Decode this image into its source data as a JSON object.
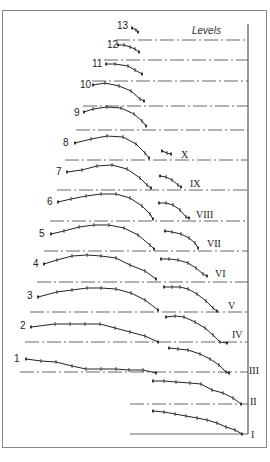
{
  "figure": {
    "legend_title": "Levels",
    "frame_color": "#888888",
    "line_color": "#222222",
    "level_labels": [
      "I",
      "II",
      "III",
      "IV",
      "V",
      "VI",
      "VII",
      "VIII",
      "IX",
      "X"
    ],
    "curve_labels": [
      "1",
      "2",
      "3",
      "4",
      "5",
      "6",
      "7",
      "8",
      "9",
      "10",
      "11",
      "12",
      "13"
    ]
  },
  "levels": [
    {
      "label": "I",
      "y": 434,
      "x1": 130
    },
    {
      "label": "II",
      "y": 404,
      "x1": 130
    },
    {
      "label": "III",
      "y": 372,
      "x1": 20
    },
    {
      "label": "IV",
      "y": 342,
      "x1": 25
    },
    {
      "label": "V",
      "y": 312,
      "x1": 30
    },
    {
      "label": "VI",
      "y": 282,
      "x1": 37
    },
    {
      "label": "VII",
      "y": 251,
      "x1": 44
    },
    {
      "label": "VIII",
      "y": 221,
      "x1": 50
    },
    {
      "label": "IX",
      "y": 190,
      "x1": 57
    },
    {
      "label": "X",
      "y": 160,
      "x1": 65
    },
    {
      "label": "",
      "y": 130,
      "x1": 76
    },
    {
      "label": "",
      "y": 106,
      "x1": 83
    },
    {
      "label": "",
      "y": 81,
      "x1": 92
    },
    {
      "label": "",
      "y": 60,
      "x1": 104
    },
    {
      "label": "",
      "y": 40,
      "x1": 116
    }
  ],
  "left_curves": [
    {
      "label": "1",
      "lx": 14,
      "ly": 362,
      "pts": [
        [
          26,
          359
        ],
        [
          41,
          361
        ],
        [
          56,
          362
        ],
        [
          72,
          366
        ],
        [
          86,
          369
        ],
        [
          101,
          369
        ],
        [
          116,
          369
        ],
        [
          129,
          370
        ],
        [
          143,
          370
        ],
        [
          156,
          373
        ]
      ]
    },
    {
      "label": "2",
      "lx": 20,
      "ly": 329,
      "pts": [
        [
          31,
          327
        ],
        [
          55,
          324
        ],
        [
          70,
          324
        ],
        [
          85,
          324
        ],
        [
          100,
          324
        ],
        [
          115,
          328
        ],
        [
          130,
          332
        ],
        [
          145,
          336
        ],
        [
          158,
          342
        ]
      ]
    },
    {
      "label": "3",
      "lx": 27,
      "ly": 299,
      "pts": [
        [
          38,
          297
        ],
        [
          57,
          292
        ],
        [
          72,
          290
        ],
        [
          87,
          288
        ],
        [
          101,
          288
        ],
        [
          116,
          289
        ],
        [
          131,
          293
        ],
        [
          145,
          300
        ],
        [
          158,
          310
        ]
      ]
    },
    {
      "label": "4",
      "lx": 33,
      "ly": 267,
      "pts": [
        [
          44,
          264
        ],
        [
          57,
          260
        ],
        [
          72,
          256
        ],
        [
          87,
          255
        ],
        [
          101,
          256
        ],
        [
          116,
          258
        ],
        [
          130,
          265
        ],
        [
          145,
          271
        ],
        [
          156,
          279
        ]
      ]
    },
    {
      "label": "5",
      "lx": 39,
      "ly": 237,
      "pts": [
        [
          51,
          234
        ],
        [
          64,
          231
        ],
        [
          79,
          227
        ],
        [
          94,
          225
        ],
        [
          109,
          225
        ],
        [
          124,
          228
        ],
        [
          138,
          235
        ],
        [
          150,
          245
        ],
        [
          154,
          249
        ]
      ]
    },
    {
      "label": "6",
      "lx": 47,
      "ly": 205,
      "pts": [
        [
          58,
          202
        ],
        [
          71,
          199
        ],
        [
          86,
          196
        ],
        [
          101,
          194
        ],
        [
          116,
          194
        ],
        [
          130,
          198
        ],
        [
          142,
          206
        ],
        [
          150,
          214
        ],
        [
          153,
          219
        ]
      ]
    },
    {
      "label": "7",
      "lx": 56,
      "ly": 175,
      "pts": [
        [
          67,
          172
        ],
        [
          82,
          170
        ],
        [
          97,
          166
        ],
        [
          112,
          165
        ],
        [
          127,
          169
        ],
        [
          140,
          178
        ],
        [
          147,
          185
        ],
        [
          151,
          188
        ]
      ]
    },
    {
      "label": "8",
      "lx": 63,
      "ly": 146,
      "pts": [
        [
          75,
          143
        ],
        [
          91,
          139
        ],
        [
          107,
          136
        ],
        [
          123,
          137
        ],
        [
          136,
          144
        ],
        [
          145,
          153
        ],
        [
          149,
          158
        ]
      ]
    },
    {
      "label": "9",
      "lx": 74,
      "ly": 116,
      "pts": [
        [
          84,
          112
        ],
        [
          93,
          109
        ],
        [
          107,
          107
        ],
        [
          121,
          108
        ],
        [
          134,
          114
        ],
        [
          142,
          121
        ],
        [
          146,
          126
        ]
      ]
    },
    {
      "label": "10",
      "lx": 80,
      "ly": 88,
      "pts": [
        [
          93,
          85
        ],
        [
          105,
          83
        ],
        [
          119,
          86
        ],
        [
          131,
          91
        ],
        [
          140,
          99
        ],
        [
          144,
          101
        ]
      ]
    },
    {
      "label": "11",
      "lx": 92,
      "ly": 67,
      "pts": [
        [
          106,
          64
        ],
        [
          115,
          64
        ],
        [
          128,
          66
        ],
        [
          135,
          70
        ],
        [
          142,
          74
        ]
      ]
    },
    {
      "label": "12",
      "lx": 107,
      "ly": 48,
      "pts": [
        [
          118,
          45
        ],
        [
          124,
          45
        ],
        [
          130,
          47
        ],
        [
          135,
          49
        ],
        [
          139,
          52
        ]
      ]
    },
    {
      "label": "13",
      "lx": 117,
      "ly": 29,
      "pts": [
        [
          132,
          28
        ],
        [
          136,
          30
        ],
        [
          138,
          32
        ]
      ]
    }
  ],
  "right_curves": [
    {
      "label": "I",
      "lx": 251,
      "ly": 438,
      "pts": [
        [
          153,
          411
        ],
        [
          164,
          412
        ],
        [
          175,
          414
        ],
        [
          186,
          416
        ],
        [
          197,
          418
        ],
        [
          207,
          420
        ],
        [
          217,
          423
        ],
        [
          226,
          427
        ],
        [
          235,
          430
        ],
        [
          242,
          434
        ]
      ]
    },
    {
      "label": "II",
      "lx": 250,
      "ly": 405,
      "pts": [
        [
          153,
          381
        ],
        [
          164,
          381
        ],
        [
          176,
          382
        ],
        [
          190,
          383
        ],
        [
          201,
          384
        ],
        [
          212,
          390
        ],
        [
          223,
          393
        ],
        [
          233,
          398
        ],
        [
          241,
          404
        ]
      ]
    },
    {
      "label": "III",
      "lx": 249,
      "ly": 374,
      "pts": [
        [
          169,
          348
        ],
        [
          178,
          349
        ],
        [
          188,
          350
        ],
        [
          200,
          354
        ],
        [
          210,
          359
        ],
        [
          219,
          365
        ],
        [
          226,
          372
        ],
        [
          229,
          373
        ]
      ]
    },
    {
      "label": "IV",
      "lx": 232,
      "ly": 338,
      "pts": [
        [
          166,
          317
        ],
        [
          175,
          316
        ],
        [
          184,
          317
        ],
        [
          195,
          322
        ],
        [
          205,
          328
        ],
        [
          213,
          335
        ],
        [
          220,
          342
        ],
        [
          227,
          343
        ]
      ]
    },
    {
      "label": "V",
      "lx": 228,
      "ly": 309,
      "pts": [
        [
          164,
          287
        ],
        [
          172,
          287
        ],
        [
          180,
          287
        ],
        [
          188,
          289
        ],
        [
          197,
          294
        ],
        [
          206,
          301
        ],
        [
          213,
          308
        ],
        [
          217,
          311
        ]
      ]
    },
    {
      "label": "VI",
      "lx": 215,
      "ly": 277,
      "pts": [
        [
          161,
          259
        ],
        [
          169,
          259
        ],
        [
          178,
          260
        ],
        [
          188,
          263
        ],
        [
          196,
          268
        ],
        [
          203,
          274
        ],
        [
          207,
          276
        ]
      ]
    },
    {
      "label": "VII",
      "lx": 207,
      "ly": 247,
      "pts": [
        [
          165,
          231
        ],
        [
          172,
          232
        ],
        [
          181,
          234
        ],
        [
          189,
          238
        ],
        [
          195,
          243
        ],
        [
          198,
          248
        ]
      ]
    },
    {
      "label": "VIII",
      "lx": 196,
      "ly": 218,
      "pts": [
        [
          159,
          203
        ],
        [
          166,
          203
        ],
        [
          173,
          205
        ],
        [
          180,
          210
        ],
        [
          186,
          217
        ],
        [
          189,
          218
        ]
      ]
    },
    {
      "label": "IX",
      "lx": 190,
      "ly": 187,
      "pts": [
        [
          160,
          176
        ],
        [
          166,
          177
        ],
        [
          172,
          180
        ],
        [
          178,
          185
        ],
        [
          181,
          187
        ]
      ]
    },
    {
      "label": "X",
      "lx": 181,
      "ly": 158,
      "pts": [
        [
          162,
          151
        ],
        [
          167,
          153
        ],
        [
          171,
          154
        ]
      ]
    }
  ]
}
